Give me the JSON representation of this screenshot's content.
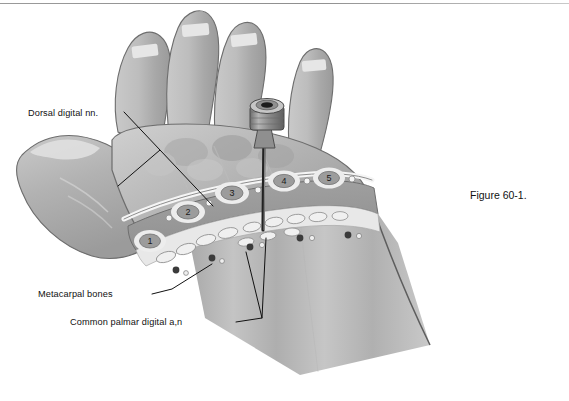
{
  "page": {
    "background_color": "#ffffff",
    "rule_color": "#9a9a9a",
    "width": 569,
    "height": 401
  },
  "figure": {
    "caption": "Figure 60-1.",
    "style": "grayscale-medical-illustration"
  },
  "labels": [
    {
      "id": "dorsal-digital-nn",
      "text": "Dorsal digital nn.",
      "x": 28,
      "y": 109
    },
    {
      "id": "metacarpal-bones",
      "text": "Metacarpal bones",
      "x": 38,
      "y": 290
    },
    {
      "id": "common-palmar-digital",
      "text": "Common palmar digital a,n",
      "x": 70,
      "y": 318
    }
  ],
  "markers": [
    {
      "label": "1",
      "x": 150,
      "y": 241
    },
    {
      "label": "2",
      "x": 188,
      "y": 212
    },
    {
      "label": "3",
      "x": 232,
      "y": 193
    },
    {
      "label": "4",
      "x": 284,
      "y": 181
    },
    {
      "label": "5",
      "x": 329,
      "y": 178
    }
  ],
  "colors": {
    "skin_light": "#d2d2d2",
    "skin_mid": "#b9b9b9",
    "skin_dark": "#a3a3a3",
    "skin_shadow": "#8e8e8e",
    "section_fill": "#9b9b9b",
    "section_rim": "#f2f2f2",
    "bone_fill": "#9a9a9a",
    "bone_halo": "#ececec",
    "vessel_dark": "#3d3d3d",
    "needle_dark": "#2b2b2b",
    "hub_gray": "#8d8d8d",
    "outline": "#4a4a4a",
    "text": "#111111"
  },
  "instrument": {
    "name": "needle-with-luer-hub",
    "hub_x": 267,
    "hub_y": 110,
    "tip_x": 262,
    "tip_y": 228
  }
}
